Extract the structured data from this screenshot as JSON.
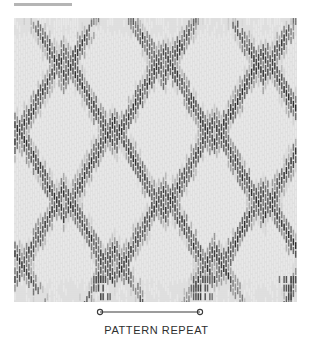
{
  "figure": {
    "top_rule": {
      "label": "section-rule",
      "color": "#b5b5b5"
    },
    "caption": "PATTERN REPEAT",
    "dimension": {
      "left_marker_x": 100,
      "right_marker_x": 200,
      "marker_y": 7,
      "line_color": "#3a3a3a",
      "marker_radius": 2.6
    }
  },
  "chart_data": {
    "type": "heatmap",
    "title": "",
    "subtitle": "",
    "xlabel": "PATTERN REPEAT",
    "ylabel": "",
    "grid": false,
    "legend": "none",
    "swatch": {
      "x": 14,
      "y": 18,
      "width": 283,
      "height": 284,
      "ground_color": "#dedede",
      "thread_dark_color": "#2b2b2b",
      "thread_mid_color": "#808080",
      "thread_light_color": "#ededed",
      "warp_count": 122,
      "warp_pitch_px": 2.32,
      "warp_width_px": 1.45,
      "dash_height_px": 7.0,
      "dash_gap_px": 1.6,
      "repeat_period_px": 100,
      "repeat_period_threads": 43,
      "chevron": {
        "peak_x_positions": [
          1,
          43,
          86,
          129,
          172,
          215,
          258,
          301
        ],
        "valley_offset_threads": 21.5,
        "band_count": 5,
        "band_centers_y": [
          12,
          80,
          150,
          218,
          278
        ],
        "band_amplitude_y": 46,
        "band_half_thickness_y": 26
      },
      "edge_rows": {
        "top_sparse": true,
        "bottom_sparse": true,
        "bottom_cluster_x": [
          100,
          200,
          290
        ]
      }
    },
    "x": [
      0,
      100,
      200,
      283
    ],
    "values": [
      0,
      1,
      0,
      1
    ],
    "xlim": [
      0,
      283
    ],
    "ylim": [
      0,
      284
    ]
  }
}
